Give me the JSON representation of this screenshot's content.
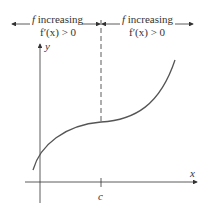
{
  "diagram": {
    "left_region": {
      "line1_f": "f",
      "line1_rest": " increasing",
      "line2": "f′(x) > 0"
    },
    "right_region": {
      "line1_f": "f",
      "line1_rest": " increasing",
      "line2": "f′(x) > 0"
    },
    "axes": {
      "x_label": "x",
      "y_label": "y",
      "tick_label": "c"
    },
    "colors": {
      "curve": "#555555",
      "axis": "#333333",
      "text": "#333333"
    }
  }
}
